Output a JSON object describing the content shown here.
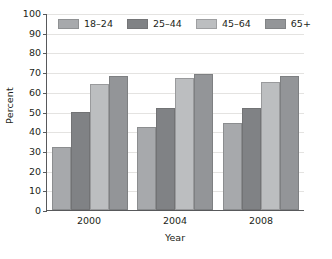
{
  "chart_data": {
    "type": "bar",
    "title": "",
    "subtitle": "",
    "xlabel": "Year",
    "ylabel": "Percent",
    "categories": [
      "2000",
      "2004",
      "2008"
    ],
    "series": [
      {
        "name": "18–24",
        "values": [
          32,
          42,
          44
        ],
        "color": "#a7a9ac"
      },
      {
        "name": "25–44",
        "values": [
          50,
          52,
          52
        ],
        "color": "#808285"
      },
      {
        "name": "45–64",
        "values": [
          64,
          67,
          65
        ],
        "color": "#bcbec0"
      },
      {
        "name": "65+",
        "values": [
          68,
          69,
          68
        ],
        "color": "#939598"
      }
    ],
    "ylim": [
      0,
      100
    ],
    "ytick_step": 10,
    "yticks": [
      "100",
      "90",
      "80",
      "70",
      "60",
      "50",
      "40",
      "30",
      "20",
      "10",
      "0"
    ],
    "grid": true,
    "grid_color": "#e4e3e1",
    "legend_position": "top-inside",
    "axis_color": "#58595b",
    "background": "#ffffff"
  }
}
